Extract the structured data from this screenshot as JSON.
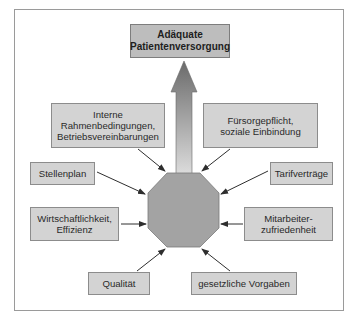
{
  "diagram": {
    "goal": {
      "label": "Adäquate\nPatientenversorgung"
    },
    "center": {
      "shape": "octagon",
      "fill": "#a3a3a3"
    },
    "factors": [
      {
        "id": "interne",
        "label": "Interne\nRahmenbedingungen,\nBetriebsvereinbarungen"
      },
      {
        "id": "fuersorge",
        "label": "Fürsorgepflicht,\nsoziale Einbindung"
      },
      {
        "id": "stellenplan",
        "label": "Stellenplan"
      },
      {
        "id": "tarif",
        "label": "Tarifverträge"
      },
      {
        "id": "wirtschaft",
        "label": "Wirtschaftlichkeit,\nEffizienz"
      },
      {
        "id": "mitarbeiter",
        "label": "Mitarbeiter-\nzufriedenheit"
      },
      {
        "id": "qualitaet",
        "label": "Qualität"
      },
      {
        "id": "gesetz",
        "label": "gesetzliche Vorgaben"
      }
    ],
    "colors": {
      "box_fill": "#d3d3d3",
      "goal_fill": "#bdbdbd",
      "box_border": "#8c8c8c",
      "arrow": "#333333",
      "main_arrow_top": "#6e6e6e",
      "main_arrow_bottom": "#d8d8d8"
    }
  }
}
